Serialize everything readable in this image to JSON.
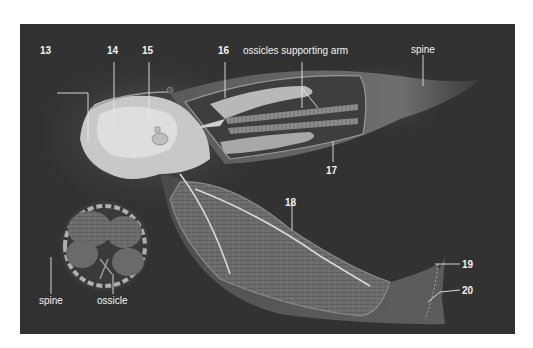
{
  "figure": {
    "colors": {
      "background": "#323232",
      "page": "#ffffff",
      "label_text": "#f2f2f2",
      "body_light": "#cfcfcf",
      "body_mid": "#8a8a8a",
      "arm_outer": "#5a5a5a"
    }
  },
  "labels": {
    "n13": "13",
    "n14": "14",
    "n15": "15",
    "n16": "16",
    "ossicles_supporting_arm": "ossicles supporting arm",
    "spine_top": "spine",
    "n17": "17",
    "n18": "18",
    "n19": "19",
    "n20": "20",
    "spine_bottom": "spine",
    "ossicle": "ossicle"
  }
}
